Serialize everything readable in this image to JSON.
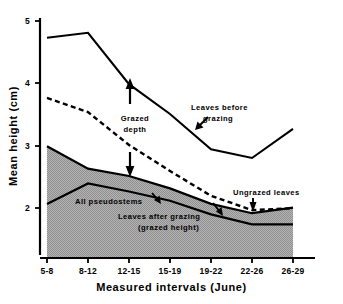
{
  "chart_data": {
    "type": "line",
    "title": "",
    "xlabel": "Measured intervals (June)",
    "ylabel": "Mean height (cm)",
    "categories": [
      "5-8",
      "8-12",
      "12-15",
      "15-19",
      "19-22",
      "22-26",
      "26-29"
    ],
    "xtick_labels": [
      "5-8",
      "8-12",
      "12-15",
      "15-19",
      "19-22",
      "22-26",
      "26-29"
    ],
    "ytick_labels": [
      "5",
      "4",
      "3",
      "2"
    ],
    "ytick_values": [
      5,
      4,
      3,
      2
    ],
    "ylim": [
      1.25,
      5.1
    ],
    "xlim": [
      0,
      6
    ],
    "grid": false,
    "legend": "none (in-plot annotations)",
    "series": [
      {
        "name": "Leaves before grazing",
        "style": "solid",
        "values": [
          4.73,
          4.81,
          3.98,
          3.5,
          2.93,
          2.79,
          3.26
        ]
      },
      {
        "name": "Ungrazed leaves",
        "style": "dashed",
        "values": [
          3.76,
          3.53,
          3.0,
          2.58,
          2.18,
          1.95,
          1.98
        ]
      },
      {
        "name": "Leaves after grazing (grazed height)",
        "style": "solid",
        "values": [
          2.98,
          2.62,
          2.5,
          2.3,
          2.05,
          1.9,
          1.99
        ]
      },
      {
        "name": "All pseudostems",
        "style": "solid",
        "values": [
          2.05,
          2.38,
          2.25,
          2.1,
          1.88,
          1.72,
          1.72
        ]
      }
    ],
    "shaded_band": {
      "label": "All pseudostems band",
      "between": [
        "Leaves after grazing (grazed height)",
        "baseline/All pseudostems"
      ],
      "fill": "#a8a8a8",
      "pattern": "fine checker hatch"
    },
    "annotations": [
      {
        "id": "grazed-depth",
        "text_line1": "Grazed",
        "text_line2": "depth",
        "arrows": 2
      },
      {
        "id": "leaves-before-grazing",
        "text_line1": "Leaves before",
        "text_line2": "grazing",
        "arrows": 1
      },
      {
        "id": "ungrazed-leaves",
        "text_line1": "Ungrazed leaves",
        "text_line2": "",
        "arrows": 1
      },
      {
        "id": "all-pseudostems",
        "text_line1": "All pseudostems",
        "text_line2": "",
        "arrows": 1
      },
      {
        "id": "leaves-after-grazing",
        "text_line1": "Leaves after grazing",
        "text_line2": "(grazed height)",
        "arrows": 0
      }
    ],
    "colors": {
      "line": "#000000",
      "shade": "#a8a8a8",
      "background": "#ffffff"
    }
  },
  "axes": {
    "y_title": "Mean height (cm)",
    "x_title": "Measured intervals (June)",
    "yticks": [
      "5",
      "4",
      "3",
      "2"
    ],
    "xticks": [
      "5-8",
      "8-12",
      "12-15",
      "15-19",
      "19-22",
      "22-26",
      "26-29"
    ]
  },
  "labels": {
    "grazed_depth_l1": "Grazed",
    "grazed_depth_l2": "depth",
    "leaves_before_l1": "Leaves before",
    "leaves_before_l2": "grazing",
    "ungrazed_leaves": "Ungrazed leaves",
    "all_pseudostems": "All pseudostems",
    "leaves_after_l1": "Leaves after grazing",
    "leaves_after_l2": "(grazed height)"
  }
}
